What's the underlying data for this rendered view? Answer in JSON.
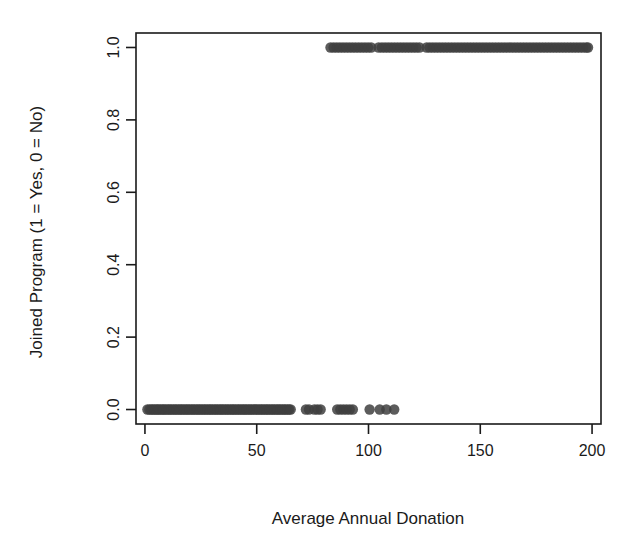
{
  "chart_data": {
    "type": "scatter",
    "title": "",
    "xlabel": "Average Annual Donation",
    "ylabel": "Joined Program (1 = Yes, 0 = No)",
    "xlim": [
      -4,
      204
    ],
    "ylim": [
      -0.04,
      1.04
    ],
    "xticks": [
      0,
      50,
      100,
      150,
      200
    ],
    "xtick_labels": [
      "0",
      "50",
      "100",
      "150",
      "200"
    ],
    "yticks": [
      0.0,
      0.2,
      0.4,
      0.6,
      0.8,
      1.0
    ],
    "ytick_labels": [
      "0.0",
      "0.2",
      "0.4",
      "0.6",
      "0.8",
      "1.0"
    ],
    "grid": false,
    "legend": false,
    "point_color": "#404040",
    "point_radius": 5.2,
    "series": [
      {
        "name": "Joined Program",
        "x": [
          1.1,
          2.0,
          2.8,
          3.5,
          4.2,
          5.0,
          5.6,
          6.3,
          7.0,
          7.8,
          8.4,
          9.1,
          9.9,
          10.6,
          11.3,
          12.0,
          12.8,
          13.5,
          14.2,
          15.0,
          15.7,
          16.4,
          17.1,
          17.9,
          18.6,
          19.3,
          20.0,
          20.8,
          21.5,
          22.2,
          23.0,
          23.7,
          24.4,
          25.1,
          25.9,
          26.6,
          27.3,
          28.1,
          28.8,
          29.5,
          30.2,
          31.0,
          31.7,
          32.4,
          33.2,
          33.9,
          34.6,
          35.3,
          36.1,
          36.8,
          37.5,
          38.3,
          39.0,
          39.7,
          40.4,
          41.2,
          41.9,
          42.6,
          43.4,
          44.1,
          44.8,
          45.5,
          46.3,
          47.0,
          47.7,
          48.5,
          49.2,
          49.9,
          50.6,
          51.4,
          52.1,
          52.8,
          53.6,
          54.3,
          55.0,
          55.7,
          56.5,
          57.2,
          57.9,
          58.7,
          59.4,
          60.1,
          60.8,
          61.6,
          62.3,
          63.0,
          63.8,
          64.5,
          65.2,
          72.0,
          73.4,
          75.8,
          77.2,
          78.6,
          86.0,
          87.4,
          88.8,
          90.2,
          91.6,
          93.0,
          100.5,
          105.0,
          108.0,
          111.5
        ],
        "y": [
          0,
          0,
          0,
          0,
          0,
          0,
          0,
          0,
          0,
          0,
          0,
          0,
          0,
          0,
          0,
          0,
          0,
          0,
          0,
          0,
          0,
          0,
          0,
          0,
          0,
          0,
          0,
          0,
          0,
          0,
          0,
          0,
          0,
          0,
          0,
          0,
          0,
          0,
          0,
          0,
          0,
          0,
          0,
          0,
          0,
          0,
          0,
          0,
          0,
          0,
          0,
          0,
          0,
          0,
          0,
          0,
          0,
          0,
          0,
          0,
          0,
          0,
          0,
          0,
          0,
          0,
          0,
          0,
          0,
          0,
          0,
          0,
          0,
          0,
          0,
          0,
          0,
          0,
          0,
          0,
          0,
          0,
          0,
          0,
          0,
          0,
          0,
          0,
          0,
          0,
          0,
          0,
          0,
          0,
          0,
          0,
          0,
          0,
          0,
          0,
          0,
          0,
          0,
          0
        ]
      },
      {
        "name": "Joined Program (yes)",
        "x": [
          83.0,
          84.4,
          85.8,
          87.2,
          88.6,
          90.0,
          91.4,
          92.8,
          94.2,
          95.6,
          97.0,
          98.4,
          99.8,
          101.2,
          104.5,
          106.0,
          107.4,
          108.8,
          110.2,
          111.6,
          113.0,
          114.4,
          115.8,
          117.2,
          118.6,
          120.0,
          121.4,
          122.8,
          126.0,
          127.4,
          128.8,
          130.2,
          131.6,
          133.0,
          134.4,
          135.8,
          137.2,
          138.6,
          140.0,
          141.4,
          142.8,
          144.2,
          145.6,
          147.0,
          148.4,
          149.8,
          151.2,
          152.6,
          154.0,
          155.4,
          156.8,
          158.2,
          159.6,
          161.0,
          162.4,
          163.8,
          165.2,
          166.6,
          168.0,
          169.4,
          170.8,
          172.2,
          173.6,
          175.0,
          176.4,
          177.8,
          179.2,
          180.6,
          182.0,
          183.4,
          184.8,
          186.2,
          187.6,
          189.0,
          190.4,
          191.8,
          193.2,
          194.6,
          196.0,
          197.4,
          198.2
        ],
        "y": [
          1,
          1,
          1,
          1,
          1,
          1,
          1,
          1,
          1,
          1,
          1,
          1,
          1,
          1,
          1,
          1,
          1,
          1,
          1,
          1,
          1,
          1,
          1,
          1,
          1,
          1,
          1,
          1,
          1,
          1,
          1,
          1,
          1,
          1,
          1,
          1,
          1,
          1,
          1,
          1,
          1,
          1,
          1,
          1,
          1,
          1,
          1,
          1,
          1,
          1,
          1,
          1,
          1,
          1,
          1,
          1,
          1,
          1,
          1,
          1,
          1,
          1,
          1,
          1,
          1,
          1,
          1,
          1,
          1,
          1,
          1,
          1,
          1,
          1,
          1,
          1,
          1,
          1,
          1,
          1,
          1
        ]
      }
    ]
  }
}
